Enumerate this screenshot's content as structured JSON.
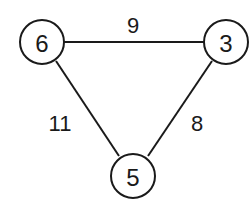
{
  "graph": {
    "nodes": [
      {
        "id": "a",
        "label": "6"
      },
      {
        "id": "b",
        "label": "3"
      },
      {
        "id": "c",
        "label": "5"
      }
    ],
    "edges": [
      {
        "from": "6",
        "to": "3",
        "weight": "9"
      },
      {
        "from": "6",
        "to": "5",
        "weight": "11"
      },
      {
        "from": "3",
        "to": "5",
        "weight": "8"
      }
    ]
  },
  "colors": {
    "stroke": "#1a1a1a",
    "background": "#ffffff"
  }
}
